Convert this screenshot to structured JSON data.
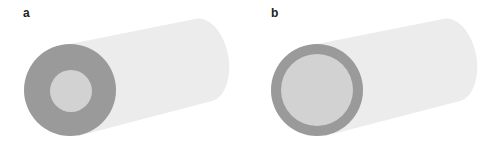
{
  "panels": [
    {
      "label": "a",
      "description": "thick-walled tube",
      "wall": "thick"
    },
    {
      "label": "b",
      "description": "thin-walled tube",
      "wall": "thin"
    }
  ],
  "colors": {
    "wall": "#9a9a9a",
    "lumen": "#d2d2d2",
    "body": "#ececec"
  }
}
